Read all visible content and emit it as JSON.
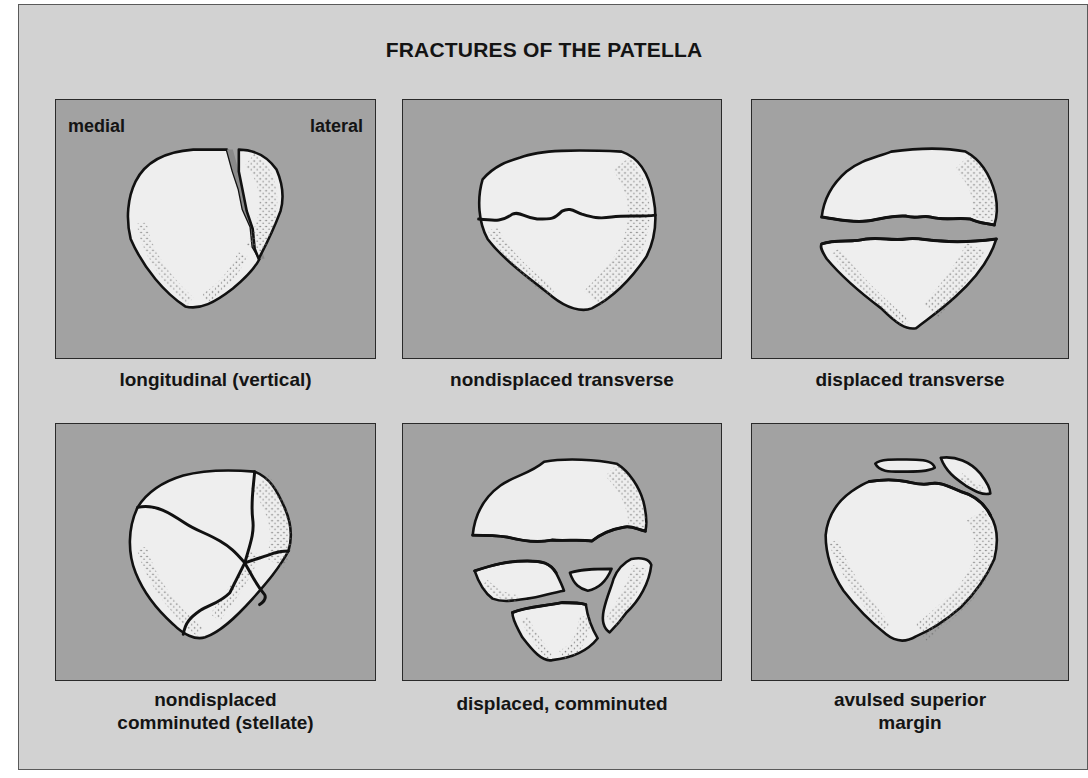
{
  "title": "FRACTURES OF THE PATELLA",
  "orientation_labels": {
    "medial": "medial",
    "lateral": "lateral"
  },
  "panels": [
    {
      "id": "longitudinal",
      "caption_line1": "longitudinal (vertical)",
      "caption_line2": ""
    },
    {
      "id": "nondisplaced-transverse",
      "caption_line1": "nondisplaced transverse",
      "caption_line2": ""
    },
    {
      "id": "displaced-transverse",
      "caption_line1": "displaced transverse",
      "caption_line2": ""
    },
    {
      "id": "nondisplaced-comminuted",
      "caption_line1": "nondisplaced",
      "caption_line2": "comminuted (stellate)"
    },
    {
      "id": "displaced-comminuted",
      "caption_line1": "displaced, comminuted",
      "caption_line2": ""
    },
    {
      "id": "avulsed-superior-margin",
      "caption_line1": "avulsed superior",
      "caption_line2": "margin"
    }
  ],
  "colors": {
    "background": "#d2d2d2",
    "panel": "#a2a2a2",
    "bone": "#eeeeee",
    "outline": "#111111"
  }
}
